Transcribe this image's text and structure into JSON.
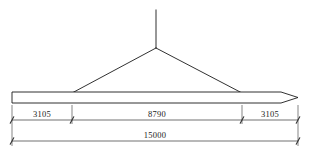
{
  "drawing": {
    "title": "Spreader beam lifting arrangement",
    "units_note": "mm",
    "beam": {
      "name": "lifting-beam",
      "left_x": 12,
      "right_x": 298,
      "top_y": 92,
      "bottom_y": 103,
      "tip_style": "tapered-point",
      "tip_start_x": 281,
      "stroke": "#1a1a1a"
    },
    "rigging": {
      "name": "sling-assembly",
      "apex_x": 156,
      "apex_y": 48,
      "hook_line_top_y": 10,
      "left_attach_x": 72,
      "right_attach_x": 242,
      "attach_y": 93,
      "stroke": "#1a1a1a"
    },
    "dimensions": {
      "chain_line_y": 120,
      "total_line_y": 141,
      "text_offset_y": -3.5,
      "extension_top_y": 105,
      "extension_bottom_y": 146,
      "tick_size": 3.2,
      "stroke": "#333333",
      "segments": [
        {
          "label": "3105",
          "from_x": 12,
          "to_x": 72
        },
        {
          "label": "8790",
          "from_x": 72,
          "to_x": 242
        },
        {
          "label": "3105",
          "from_x": 242,
          "to_x": 298
        }
      ],
      "total": {
        "label": "15000",
        "from_x": 12,
        "to_x": 298
      }
    },
    "colors": {
      "line": "#1a1a1a",
      "dimension_line": "#333333",
      "text": "#1a1a1a",
      "background": "#ffffff"
    }
  }
}
